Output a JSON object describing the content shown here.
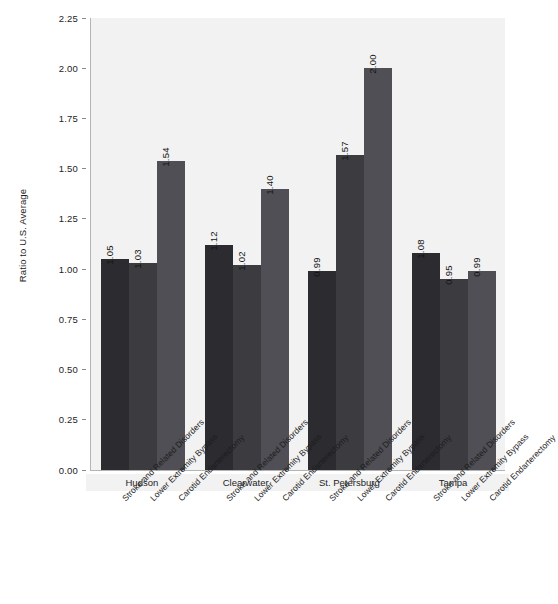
{
  "chart_data": {
    "type": "bar",
    "title": "",
    "subtitle": "",
    "xlabel": "",
    "ylabel": "Ratio to U.S. Average",
    "ylim": [
      0.0,
      2.25
    ],
    "ytick_labels": [
      "0.00",
      "0.25",
      "0.50",
      "0.75",
      "1.00",
      "1.25",
      "1.50",
      "1.75",
      "2.00",
      "2.25"
    ],
    "ytick_values": [
      0.0,
      0.25,
      0.5,
      0.75,
      1.0,
      1.25,
      1.5,
      1.75,
      2.0,
      2.25
    ],
    "grid": false,
    "legend_position": "none",
    "categories": [
      "Stroke and Related Disorders",
      "Lower Extremity Bypass",
      "Carotid Endarterectomy"
    ],
    "groups": [
      "Hudson",
      "Clearwater",
      "St. Petersburg",
      "Tampa"
    ],
    "series": [
      {
        "name": "Hudson",
        "values": [
          1.05,
          1.03,
          1.54
        ],
        "labels": [
          "1.05",
          "1.03",
          "1.54"
        ]
      },
      {
        "name": "Clearwater",
        "values": [
          1.12,
          1.02,
          1.4
        ],
        "labels": [
          "1.12",
          "1.02",
          "1.40"
        ]
      },
      {
        "name": "St. Petersburg",
        "values": [
          0.99,
          1.57,
          2.0
        ],
        "labels": [
          "0.99",
          "1.57",
          "2.00"
        ]
      },
      {
        "name": "Tampa",
        "values": [
          1.08,
          0.95,
          0.99
        ],
        "labels": [
          "1.08",
          "0.95",
          "0.99"
        ]
      }
    ],
    "bar_colors": [
      "#2b2b30",
      "#3b3b40",
      "#4f4f55"
    ],
    "plot_background": "#f2f2f2",
    "axis_color": "#b4b4b4",
    "text_color": "#1d1d1d"
  }
}
